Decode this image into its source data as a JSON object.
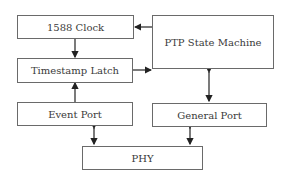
{
  "diagram": {
    "blocks": {
      "clock": "1588 Clock",
      "latch": "Timestamp Latch",
      "state_machine": "PTP State Machine",
      "event_port": "Event Port",
      "general_port": "General Port",
      "phy": "PHY"
    },
    "connections": [
      {
        "from": "PTP State Machine",
        "to": "1588 Clock",
        "direction": "one-way"
      },
      {
        "from": "1588 Clock",
        "to": "Timestamp Latch",
        "direction": "one-way"
      },
      {
        "from": "Timestamp Latch",
        "to": "PTP State Machine",
        "direction": "one-way"
      },
      {
        "from": "Event Port",
        "to": "Timestamp Latch",
        "direction": "one-way"
      },
      {
        "from": "PTP State Machine",
        "to": "General Port",
        "direction": "bidirectional"
      },
      {
        "from": "Event Port",
        "to": "PHY",
        "direction": "bidirectional"
      },
      {
        "from": "General Port",
        "to": "PHY",
        "direction": "bidirectional"
      }
    ]
  }
}
